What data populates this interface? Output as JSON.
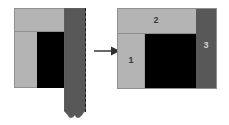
{
  "figure": {
    "background_color": "#ffffff"
  },
  "colors": {
    "light_gray": "#b4b4b4",
    "dark_gray": "#585858",
    "core_black": "#000000",
    "outline": "#8f8f8f",
    "label_dark": "#3a3a3a",
    "label_light": "#d2d2d2",
    "arrow": "#444444",
    "dashed_line": "#1e1e1e"
  },
  "left_figure": {
    "name": "exploded-view",
    "parts": {
      "top_band": {
        "name": "top-band",
        "fill": "#b4b4b4"
      },
      "side_column": {
        "name": "side-column",
        "fill": "#b4b4b4"
      },
      "core_block": {
        "name": "core-block",
        "fill": "#000000"
      },
      "detached_strip": {
        "name": "detached-strip",
        "fill": "#585858",
        "edge_style": "dashed",
        "bottom_edge": "torn"
      }
    }
  },
  "arrow": {
    "name": "transform-arrow",
    "direction": "right",
    "color": "#444444"
  },
  "right_figure": {
    "name": "assembled-view",
    "regions": [
      {
        "id": "1",
        "label": "1",
        "fill": "#b4b4b4",
        "label_color": "#3a3a3a"
      },
      {
        "id": "2",
        "label": "2",
        "fill": "#b4b4b4",
        "label_color": "#3a3a3a"
      },
      {
        "id": "3",
        "label": "3",
        "fill": "#585858",
        "label_color": "#d2d2d2"
      }
    ],
    "core": {
      "name": "core-block",
      "fill": "#000000"
    }
  }
}
